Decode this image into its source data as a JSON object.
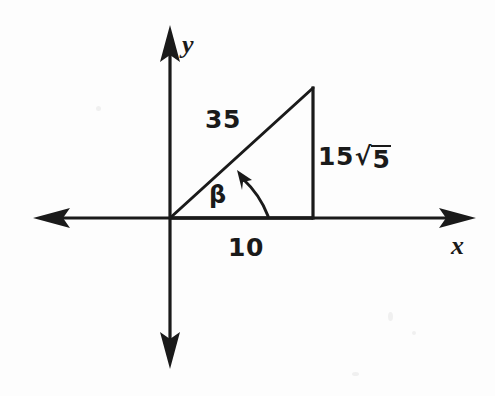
{
  "figure": {
    "type": "geometry-diagram",
    "background_color": "#fdfdfd",
    "ink_color": "#1a1a1a"
  },
  "axes": {
    "x_label": "x",
    "y_label": "y",
    "x_arrowheads": [
      "left",
      "right"
    ],
    "y_arrowheads": [
      "up",
      "down"
    ],
    "origin": {
      "x": 170,
      "y": 218
    }
  },
  "triangle": {
    "vertices": {
      "origin": {
        "x": 170,
        "y": 218
      },
      "base_right": {
        "x": 313,
        "y": 218
      },
      "apex": {
        "x": 313,
        "y": 88
      }
    },
    "sides": {
      "hypotenuse_label": "35",
      "base_label": "10",
      "vertical_label_coefficient": "15",
      "vertical_label_radical_symbol": "√",
      "vertical_label_radicand": "5",
      "vertical_label_full": "15√5"
    }
  },
  "angle": {
    "symbol": "β",
    "name": "beta",
    "vertex": "origin",
    "from": "positive x-axis",
    "to": "hypotenuse",
    "direction": "counterclockwise",
    "arc_arrowhead": true
  }
}
